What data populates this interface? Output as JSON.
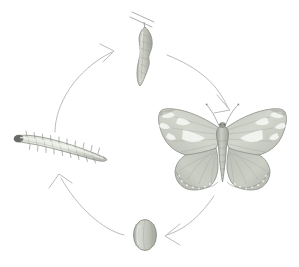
{
  "figure": {
    "type": "cycle-diagram",
    "background_color": "#ffffff",
    "width": 299,
    "height": 267
  },
  "palette": {
    "arrow_stroke": "#b3b3b3",
    "outline": "#8c8c8c",
    "outline_dark": "#6e6e6e",
    "body_fill_light": "#e6e8e3",
    "body_fill_mid": "#c9ccc3",
    "body_fill_dark": "#a9ada2",
    "highlight": "#f4f5f1",
    "twig": "#9a9a9a",
    "head_dark": "#6a6a66"
  },
  "stages": [
    {
      "id": "chrysalis",
      "name": "chrysalis",
      "label": "Chrysalis",
      "position": "top",
      "cx": 145,
      "cy": 50,
      "description": "Angular pupa hanging from a twig"
    },
    {
      "id": "butterfly",
      "name": "butterfly",
      "label": "Adult Butterfly",
      "position": "right",
      "cx": 222,
      "cy": 148,
      "description": "Adult with spread patterned wings"
    },
    {
      "id": "egg",
      "name": "egg",
      "label": "Egg",
      "position": "bottom",
      "cx": 145,
      "cy": 235,
      "description": "Ribbed oval egg"
    },
    {
      "id": "caterpillar",
      "name": "caterpillar",
      "label": "Caterpillar",
      "position": "left",
      "cx": 62,
      "cy": 148,
      "description": "Spiny elongated larva"
    }
  ],
  "arrows": [
    {
      "id": "caterpillar-to-chrysalis",
      "from": "caterpillar",
      "to": "chrysalis",
      "direction": "up-right"
    },
    {
      "id": "chrysalis-to-butterfly",
      "from": "chrysalis",
      "to": "butterfly",
      "direction": "down-right"
    },
    {
      "id": "butterfly-to-egg",
      "from": "butterfly",
      "to": "egg",
      "direction": "down-left"
    },
    {
      "id": "egg-to-caterpillar",
      "from": "egg",
      "to": "caterpillar",
      "direction": "up-left"
    }
  ]
}
